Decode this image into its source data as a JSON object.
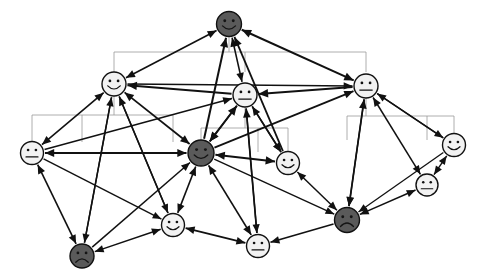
{
  "diagram": {
    "title": "Hierarchical smiley-face agent network",
    "type": "node-link-diagram",
    "background_color": "#ffffff",
    "canvas": {
      "width": 479,
      "height": 279
    },
    "node_fill_dark": "#5a5a5a",
    "node_fill_light": "#f2f2f2",
    "node_stroke": "#111111",
    "edge_color": "#111111",
    "hierarchy_line_color": "#9a9a9a",
    "legend": {
      "dark_meaning": "dark-filled agent node",
      "light_meaning": "light-filled agent node"
    },
    "nodes": [
      {
        "id": "n1",
        "name": "node-top-root",
        "x": 229,
        "y": 24,
        "r": 12.5,
        "fill": "dark",
        "face": "smile",
        "level": 1
      },
      {
        "id": "n2",
        "name": "node-left-branch",
        "x": 114,
        "y": 84,
        "r": 12.0,
        "fill": "light",
        "face": "smile",
        "level": 2
      },
      {
        "id": "n3",
        "name": "node-center-branch",
        "x": 245,
        "y": 95,
        "r": 12.0,
        "fill": "light",
        "face": "neutral",
        "level": 2
      },
      {
        "id": "n4",
        "name": "node-right-branch",
        "x": 366,
        "y": 86,
        "r": 12.0,
        "fill": "light",
        "face": "neutral",
        "level": 2
      },
      {
        "id": "n5",
        "name": "node-far-left-leaf",
        "x": 32,
        "y": 153,
        "r": 11.5,
        "fill": "light",
        "face": "neutral",
        "level": 3
      },
      {
        "id": "n6",
        "name": "node-center-hub",
        "x": 201,
        "y": 153,
        "r": 13.0,
        "fill": "dark",
        "face": "smile",
        "level": 3
      },
      {
        "id": "n7",
        "name": "node-center-right",
        "x": 288,
        "y": 163,
        "r": 11.5,
        "fill": "light",
        "face": "smile",
        "level": 3
      },
      {
        "id": "n8",
        "name": "node-far-right-leaf",
        "x": 454,
        "y": 145,
        "r": 11.5,
        "fill": "light",
        "face": "smile",
        "level": 3
      },
      {
        "id": "n9",
        "name": "node-right-lower",
        "x": 427,
        "y": 185,
        "r": 11.0,
        "fill": "light",
        "face": "neutral",
        "level": 3
      },
      {
        "id": "n10",
        "name": "node-right-dark-leaf",
        "x": 347,
        "y": 220,
        "r": 12.5,
        "fill": "dark",
        "face": "frown",
        "level": 3
      },
      {
        "id": "n11",
        "name": "node-bottom-mid-left",
        "x": 173,
        "y": 225,
        "r": 11.5,
        "fill": "light",
        "face": "smile",
        "level": 3
      },
      {
        "id": "n12",
        "name": "node-bottom-center",
        "x": 258,
        "y": 246,
        "r": 11.5,
        "fill": "light",
        "face": "neutral",
        "level": 3
      },
      {
        "id": "n13",
        "name": "node-bottom-left-dark",
        "x": 82,
        "y": 256,
        "r": 12.0,
        "fill": "dark",
        "face": "frown",
        "level": 3
      }
    ],
    "hierarchy_brackets": [
      {
        "name": "bracket-root-to-level2",
        "parent": "n1",
        "stem_x": 229,
        "stem_top": 36,
        "bar_y": 52,
        "children_x": [
          114,
          245,
          366
        ],
        "child_stop_y": 72
      },
      {
        "name": "bracket-left-branch",
        "parent": "n2",
        "stem_x": 114,
        "stem_top": 96,
        "bar_y": 115,
        "children_x": [
          32,
          82,
          173
        ],
        "child_stop_y": 142
      },
      {
        "name": "bracket-center-branch",
        "parent": "n3",
        "stem_x": 245,
        "stem_top": 107,
        "bar_y": 128,
        "children_x": [
          201,
          258,
          288
        ],
        "child_stop_y": 152
      },
      {
        "name": "bracket-right-branch",
        "parent": "n4",
        "stem_x": 366,
        "stem_top": 98,
        "bar_y": 116,
        "children_x": [
          347,
          427,
          454
        ],
        "child_stop_y": 140
      }
    ],
    "edges": [
      {
        "from": "n2",
        "to": "n1",
        "arrow": "both",
        "weight": 1.6
      },
      {
        "from": "n4",
        "to": "n1",
        "arrow": "both",
        "weight": 2.0
      },
      {
        "from": "n6",
        "to": "n1",
        "arrow": "forward",
        "weight": 2.0
      },
      {
        "from": "n3",
        "to": "n1",
        "arrow": "both",
        "weight": 1.6
      },
      {
        "from": "n7",
        "to": "n1",
        "arrow": "forward",
        "weight": 1.8
      },
      {
        "from": "n3",
        "to": "n2",
        "arrow": "forward",
        "weight": 2.0
      },
      {
        "from": "n4",
        "to": "n3",
        "arrow": "forward",
        "weight": 2.2
      },
      {
        "from": "n2",
        "to": "n4",
        "arrow": "forward",
        "weight": 1.5
      },
      {
        "from": "n5",
        "to": "n2",
        "arrow": "both",
        "weight": 1.6
      },
      {
        "from": "n6",
        "to": "n2",
        "arrow": "both",
        "weight": 1.8
      },
      {
        "from": "n11",
        "to": "n2",
        "arrow": "forward",
        "weight": 1.6
      },
      {
        "from": "n13",
        "to": "n2",
        "arrow": "forward",
        "weight": 1.5
      },
      {
        "from": "n5",
        "to": "n3",
        "arrow": "forward",
        "weight": 1.5
      },
      {
        "from": "n6",
        "to": "n3",
        "arrow": "both",
        "weight": 2.0
      },
      {
        "from": "n7",
        "to": "n3",
        "arrow": "both",
        "weight": 1.6
      },
      {
        "from": "n12",
        "to": "n3",
        "arrow": "forward",
        "weight": 1.7
      },
      {
        "from": "n6",
        "to": "n4",
        "arrow": "forward",
        "weight": 1.8
      },
      {
        "from": "n9",
        "to": "n4",
        "arrow": "both",
        "weight": 1.5
      },
      {
        "from": "n10",
        "to": "n4",
        "arrow": "both",
        "weight": 1.7
      },
      {
        "from": "n8",
        "to": "n4",
        "arrow": "forward",
        "weight": 1.5
      },
      {
        "from": "n5",
        "to": "n6",
        "arrow": "both",
        "weight": 1.8
      },
      {
        "from": "n6",
        "to": "n7",
        "arrow": "both",
        "weight": 2.0
      },
      {
        "from": "n11",
        "to": "n6",
        "arrow": "both",
        "weight": 1.6
      },
      {
        "from": "n12",
        "to": "n6",
        "arrow": "both",
        "weight": 1.7
      },
      {
        "from": "n13",
        "to": "n6",
        "arrow": "forward",
        "weight": 1.5
      },
      {
        "from": "n10",
        "to": "n7",
        "arrow": "both",
        "weight": 1.5
      },
      {
        "from": "n3",
        "to": "n7",
        "arrow": "forward",
        "weight": 1.5
      },
      {
        "from": "n5",
        "to": "n13",
        "arrow": "both",
        "weight": 1.6
      },
      {
        "from": "n11",
        "to": "n13",
        "arrow": "both",
        "weight": 1.5
      },
      {
        "from": "n11",
        "to": "n12",
        "arrow": "both",
        "weight": 1.6
      },
      {
        "from": "n10",
        "to": "n12",
        "arrow": "forward",
        "weight": 1.6
      },
      {
        "from": "n9",
        "to": "n10",
        "arrow": "both",
        "weight": 1.5
      },
      {
        "from": "n8",
        "to": "n9",
        "arrow": "both",
        "weight": 1.4
      },
      {
        "from": "n2",
        "to": "n13",
        "arrow": "forward",
        "weight": 1.4
      },
      {
        "from": "n2",
        "to": "n11",
        "arrow": "forward",
        "weight": 1.4
      },
      {
        "from": "n4",
        "to": "n8",
        "arrow": "forward",
        "weight": 1.4
      },
      {
        "from": "n4",
        "to": "n10",
        "arrow": "forward",
        "weight": 1.4
      },
      {
        "from": "n3",
        "to": "n12",
        "arrow": "forward",
        "weight": 1.4
      },
      {
        "from": "n3",
        "to": "n6",
        "arrow": "forward",
        "weight": 1.4
      },
      {
        "from": "n6",
        "to": "n10",
        "arrow": "forward",
        "weight": 1.4
      },
      {
        "from": "n5",
        "to": "n11",
        "arrow": "forward",
        "weight": 1.4
      },
      {
        "from": "n8",
        "to": "n10",
        "arrow": "forward",
        "weight": 1.3
      }
    ]
  }
}
